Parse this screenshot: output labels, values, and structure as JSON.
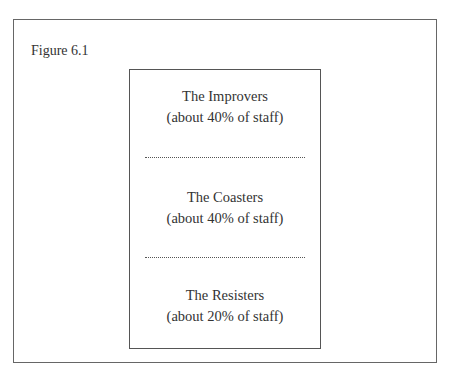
{
  "figure": {
    "label": "Figure 6.1",
    "segments": [
      {
        "title": "The Improvers",
        "share": "(about 40% of staff)"
      },
      {
        "title": "The Coasters",
        "share": "(about 40% of staff)"
      },
      {
        "title": "The Resisters",
        "share": "(about 20% of staff)"
      }
    ]
  }
}
